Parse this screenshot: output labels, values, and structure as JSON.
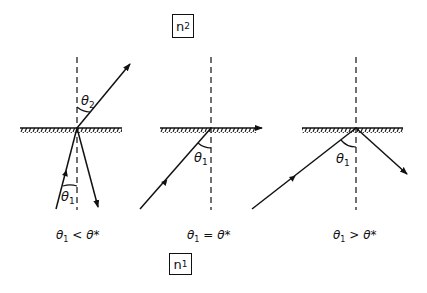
{
  "media_labels": {
    "upper": {
      "symbol": "n",
      "subscript": "2"
    },
    "lower": {
      "symbol": "n",
      "subscript": "1"
    }
  },
  "panels": [
    {
      "id": "subcritical",
      "incident_angle_label": {
        "symbol": "θ",
        "subscript": "1"
      },
      "refracted_angle_label": {
        "symbol": "θ",
        "subscript": "2"
      },
      "condition": {
        "lhs": "θ",
        "lhs_sub": "1",
        "op": "<",
        "rhs": "θ*"
      }
    },
    {
      "id": "critical",
      "incident_angle_label": {
        "symbol": "θ",
        "subscript": "1"
      },
      "condition": {
        "lhs": "θ",
        "lhs_sub": "1",
        "op": "=",
        "rhs": "θ*"
      }
    },
    {
      "id": "supercritical",
      "incident_angle_label": {
        "symbol": "θ",
        "subscript": "1"
      },
      "condition": {
        "lhs": "θ",
        "lhs_sub": "1",
        "op": ">",
        "rhs": "θ*"
      }
    }
  ]
}
